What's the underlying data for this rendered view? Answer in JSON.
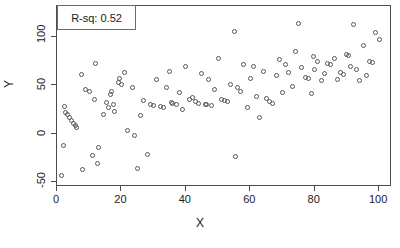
{
  "chart_data": {
    "type": "scatter",
    "title": "",
    "xlabel": "X",
    "ylabel": "Y",
    "xlim": [
      0,
      104
    ],
    "ylim": [
      -55,
      132
    ],
    "xticks": [
      0,
      20,
      40,
      60,
      80,
      100
    ],
    "yticks": [
      -50,
      0,
      50,
      100
    ],
    "grid": false,
    "marker": "open-circle",
    "annotations": [
      {
        "name": "r-squared-legend",
        "text": "R-sq: 0.52",
        "boxed": true,
        "position": "top-left"
      }
    ],
    "series": [
      {
        "name": "observations",
        "n": 112,
        "points": [
          [
            1.5,
            -43
          ],
          [
            2.0,
            -12
          ],
          [
            2.3,
            28
          ],
          [
            2.6,
            22
          ],
          [
            3.2,
            20
          ],
          [
            3.8,
            17
          ],
          [
            4.4,
            14
          ],
          [
            5.0,
            11
          ],
          [
            5.6,
            9
          ],
          [
            6.2,
            6
          ],
          [
            7.5,
            61
          ],
          [
            8.0,
            -37
          ],
          [
            9.0,
            46
          ],
          [
            10.0,
            44
          ],
          [
            11.0,
            -22
          ],
          [
            11.5,
            35
          ],
          [
            12.0,
            73
          ],
          [
            12.5,
            -31
          ],
          [
            13.0,
            -14
          ],
          [
            14.5,
            20
          ],
          [
            15.5,
            32
          ],
          [
            16.0,
            27
          ],
          [
            16.5,
            41
          ],
          [
            17.0,
            44
          ],
          [
            17.5,
            30
          ],
          [
            18.0,
            23
          ],
          [
            19.0,
            53
          ],
          [
            19.5,
            57
          ],
          [
            20.0,
            51
          ],
          [
            21.0,
            63
          ],
          [
            22.0,
            3
          ],
          [
            23.5,
            48
          ],
          [
            24.0,
            -2
          ],
          [
            25.0,
            -36
          ],
          [
            26.0,
            19
          ],
          [
            27.0,
            34
          ],
          [
            28.0,
            -21
          ],
          [
            29.0,
            30
          ],
          [
            30.0,
            29
          ],
          [
            31.0,
            56
          ],
          [
            32.0,
            28
          ],
          [
            33.0,
            27
          ],
          [
            34.0,
            48
          ],
          [
            35.0,
            64
          ],
          [
            35.5,
            32
          ],
          [
            36.0,
            31
          ],
          [
            37.0,
            30
          ],
          [
            38.0,
            43
          ],
          [
            39.0,
            25
          ],
          [
            40.0,
            69
          ],
          [
            41.0,
            35
          ],
          [
            42.0,
            37
          ],
          [
            43.0,
            33
          ],
          [
            44.0,
            31
          ],
          [
            45.0,
            62
          ],
          [
            46.0,
            30
          ],
          [
            46.5,
            30
          ],
          [
            47.0,
            56
          ],
          [
            48.0,
            29
          ],
          [
            49.0,
            46
          ],
          [
            50.0,
            78
          ],
          [
            51.0,
            35
          ],
          [
            52.0,
            34
          ],
          [
            53.0,
            33
          ],
          [
            54.0,
            51
          ],
          [
            55.0,
            106
          ],
          [
            55.5,
            -24
          ],
          [
            56.0,
            48
          ],
          [
            57.0,
            44
          ],
          [
            58.0,
            72
          ],
          [
            59.0,
            27
          ],
          [
            60.0,
            57
          ],
          [
            61.0,
            70
          ],
          [
            62.0,
            39
          ],
          [
            63.0,
            17
          ],
          [
            64.0,
            64
          ],
          [
            65.0,
            36
          ],
          [
            66.0,
            33
          ],
          [
            67.0,
            31
          ],
          [
            68.0,
            60
          ],
          [
            69.0,
            77
          ],
          [
            70.0,
            43
          ],
          [
            71.0,
            72
          ],
          [
            72.0,
            63
          ],
          [
            73.0,
            49
          ],
          [
            74.0,
            85
          ],
          [
            75.0,
            114
          ],
          [
            76.0,
            68
          ],
          [
            77.0,
            58
          ],
          [
            78.0,
            57
          ],
          [
            79.0,
            42
          ],
          [
            79.5,
            80
          ],
          [
            80.0,
            66
          ],
          [
            81.0,
            75
          ],
          [
            82.0,
            55
          ],
          [
            83.0,
            62
          ],
          [
            84.0,
            73
          ],
          [
            85.0,
            72
          ],
          [
            86.0,
            78
          ],
          [
            87.0,
            56
          ],
          [
            88.0,
            63
          ],
          [
            89.0,
            61
          ],
          [
            90.0,
            82
          ],
          [
            90.5,
            81
          ],
          [
            91.0,
            70
          ],
          [
            92.0,
            113
          ],
          [
            93.0,
            66
          ],
          [
            94.0,
            55
          ],
          [
            95.0,
            91
          ],
          [
            96.0,
            60
          ],
          [
            97.0,
            75
          ],
          [
            98.0,
            74
          ],
          [
            99.0,
            105
          ],
          [
            100.0,
            97
          ]
        ]
      }
    ]
  }
}
